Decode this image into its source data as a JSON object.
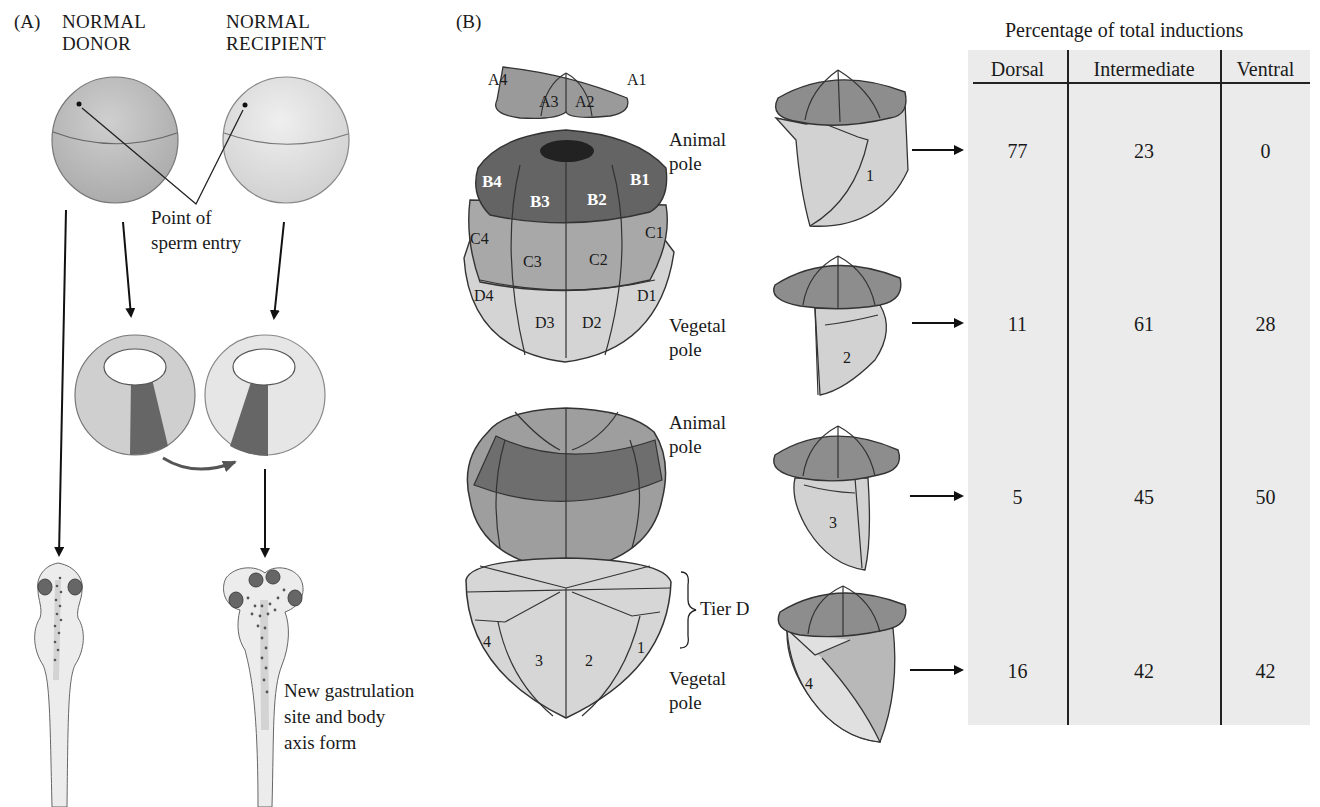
{
  "panel_a": {
    "label": "(A)",
    "donor_title_line1": "NORMAL",
    "donor_title_line2": "DONOR",
    "recipient_title_line1": "NORMAL",
    "recipient_title_line2": "RECIPIENT",
    "sperm_label_line1": "Point of",
    "sperm_label_line2": "sperm entry",
    "result_line1": "New gastrulation",
    "result_line2": "site and body",
    "result_line3": "axis form"
  },
  "panel_b": {
    "label": "(B)",
    "tier_a": [
      "A4",
      "A3",
      "A2",
      "A1"
    ],
    "tier_b": [
      "B4",
      "B3",
      "B2",
      "B1"
    ],
    "tier_c": [
      "C4",
      "C3",
      "C2",
      "C1"
    ],
    "tier_d": [
      "D4",
      "D3",
      "D2",
      "D1"
    ],
    "animal_pole_1": [
      "Animal",
      "pole"
    ],
    "vegetal_pole_1": [
      "Vegetal",
      "pole"
    ],
    "animal_pole_2": [
      "Animal",
      "pole"
    ],
    "vegetal_pole_2": [
      "Vegetal",
      "pole"
    ],
    "tier_d_label": "Tier D",
    "tier_d_cells": [
      "4",
      "3",
      "2",
      "1"
    ],
    "explant_numbers": [
      "1",
      "2",
      "3",
      "4"
    ]
  },
  "chart_data": {
    "type": "table",
    "title": "Percentage of total inductions",
    "columns": [
      "Dorsal",
      "Intermediate",
      "Ventral"
    ],
    "rows": [
      {
        "explant": "1",
        "values": [
          77,
          23,
          0
        ]
      },
      {
        "explant": "2",
        "values": [
          11,
          61,
          28
        ]
      },
      {
        "explant": "3",
        "values": [
          5,
          45,
          50
        ]
      },
      {
        "explant": "4",
        "values": [
          16,
          42,
          42
        ]
      }
    ]
  },
  "colors": {
    "text": "#1a1a1a",
    "table_bg": "#ebebeb",
    "tier_a": "#8a8a8a",
    "tier_b": "#5e5e5e",
    "tier_c": "#9a9a9a",
    "tier_d": "#d2d2d2"
  }
}
